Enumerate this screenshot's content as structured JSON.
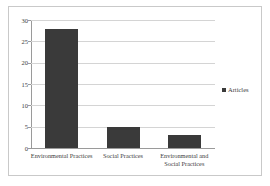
{
  "chart_data": {
    "type": "bar",
    "title": "",
    "subtitle": "",
    "xlabel": "",
    "ylabel": "",
    "categories": [
      "Environmental Practices",
      "Social Practices",
      "Environmental and\nSocial Practices"
    ],
    "series": [
      {
        "name": "Articles",
        "values": [
          28,
          5,
          3
        ],
        "color": "#3a3a3a"
      }
    ],
    "values": [
      28,
      5,
      3
    ],
    "ylim": [
      0,
      30
    ],
    "ytick_labels": [
      "30",
      "25",
      "20",
      "15",
      "10",
      "5",
      "0"
    ],
    "ytick_values": [
      30,
      25,
      20,
      15,
      10,
      5,
      0
    ],
    "grid": true,
    "grid_axis": "y",
    "legend": {
      "position": "right",
      "entries": [
        {
          "label": "Articles",
          "color": "#3a3a3a"
        }
      ]
    },
    "colors": {
      "bar": "#3a3a3a",
      "gridline": "#d4d4d4",
      "axis": "#9a9a9a",
      "frame": "#c9c9c9",
      "background": "#ffffff",
      "text": "#3c3c3c"
    }
  }
}
